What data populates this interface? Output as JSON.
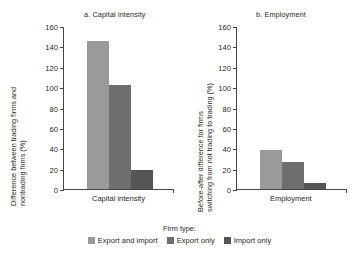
{
  "chart_data": {
    "type": "bar",
    "title": "",
    "grid": false,
    "legend_position": "bottom",
    "legend_title": "Firm type:",
    "series": [
      {
        "name": "Export and import",
        "color": "#9a9a9a",
        "values": [
          145,
          38
        ]
      },
      {
        "name": "Export only",
        "color": "#6e6e6e",
        "values": [
          102,
          27
        ]
      },
      {
        "name": "Import only",
        "color": "#555555",
        "values": [
          19,
          6
        ]
      }
    ],
    "panels": [
      {
        "key": "a",
        "title": "a. Capital intensity",
        "ylabel_line1": "Difference between trading firms and",
        "ylabel_line2": "nontrading firms (%)",
        "xlabel": "",
        "categories": [
          "Capital intensity"
        ],
        "values": [
          145,
          102,
          19
        ],
        "ylim": [
          0,
          160
        ],
        "yticks": [
          0,
          20,
          40,
          60,
          80,
          100,
          120,
          140,
          160
        ]
      },
      {
        "key": "b",
        "title": "b. Employment",
        "ylabel_line1": "Before-after difference for firms",
        "ylabel_line2": "switching from not trading to trading (%)",
        "xlabel": "",
        "categories": [
          "Employment"
        ],
        "values": [
          38,
          27,
          6
        ],
        "ylim": [
          0,
          160
        ],
        "yticks": [
          0,
          20,
          40,
          60,
          80,
          100,
          120,
          140,
          160
        ]
      }
    ]
  },
  "colors": {
    "axis": "#4a4545",
    "text": "#2b2726",
    "background": "#ffffff",
    "series_1": "#9a9a9a",
    "series_2": "#6e6e6e",
    "series_3": "#555555"
  }
}
